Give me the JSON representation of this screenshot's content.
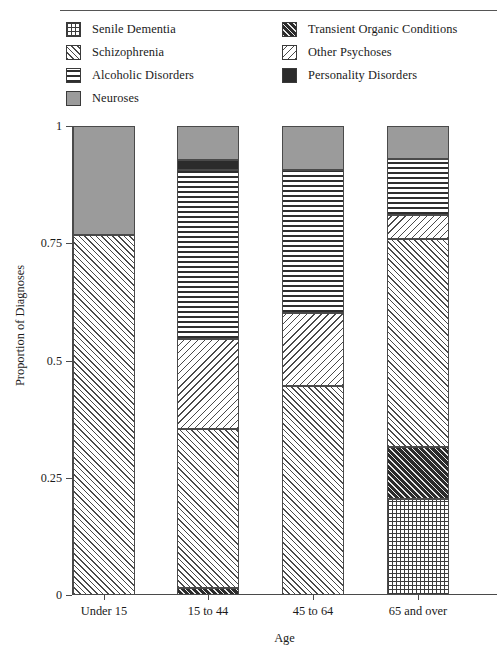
{
  "chart_data": {
    "type": "bar",
    "subtype": "stacked-bar-proportional",
    "title": "",
    "xlabel": "Age",
    "ylabel": "Proportion of Diagnoses",
    "categories": [
      "Under 15",
      "15 to 44",
      "45 to 64",
      "65 and over"
    ],
    "ylim": [
      0,
      1
    ],
    "ytick_labels": [
      "0",
      "0.25",
      "0.5",
      "0.75",
      "1"
    ],
    "ytick_values": [
      0,
      0.25,
      0.5,
      0.75,
      1
    ],
    "grid": false,
    "legend_position": "top",
    "series": [
      {
        "name": "Senile Dementia",
        "pattern": "grid",
        "values": [
          0.0,
          0.0,
          0.0,
          0.205
        ]
      },
      {
        "name": "Transient Organic Conditions",
        "pattern": "densediag",
        "values": [
          0.0,
          0.015,
          0.0,
          0.111
        ]
      },
      {
        "name": "Schizophrenia",
        "pattern": "fdiag",
        "values": [
          0.768,
          0.338,
          0.445,
          0.444
        ]
      },
      {
        "name": "Other Psychoses",
        "pattern": "bdiag",
        "values": [
          0.0,
          0.192,
          0.156,
          0.05
        ]
      },
      {
        "name": "Alcoholic Disorders",
        "pattern": "dots",
        "values": [
          0.0,
          0.361,
          0.305,
          0.12
        ]
      },
      {
        "name": "Personality Disorders",
        "pattern": "soliddark",
        "values": [
          0.0,
          0.021,
          0.0,
          0.0
        ]
      },
      {
        "name": "Neuroses",
        "pattern": "solidgray",
        "values": [
          0.232,
          0.073,
          0.094,
          0.07
        ]
      }
    ]
  },
  "legend": {
    "left_column": [
      {
        "label": "Senile Dementia",
        "pattern": "grid"
      },
      {
        "label": "Schizophrenia",
        "pattern": "fdiag"
      },
      {
        "label": "Alcoholic Disorders",
        "pattern": "dots"
      },
      {
        "label": "Neuroses",
        "pattern": "solidgray"
      }
    ],
    "right_column": [
      {
        "label": "Transient Organic Conditions",
        "pattern": "densediag"
      },
      {
        "label": "Other Psychoses",
        "pattern": "bdiag"
      },
      {
        "label": "Personality Disorders",
        "pattern": "soliddark"
      }
    ]
  },
  "colors": {
    "neuroses_gray": "#9b9b9b",
    "personality_dark": "#2b2b2b",
    "axis": "#4a4a4a",
    "text": "#1a1a1a",
    "background": "#ffffff"
  }
}
